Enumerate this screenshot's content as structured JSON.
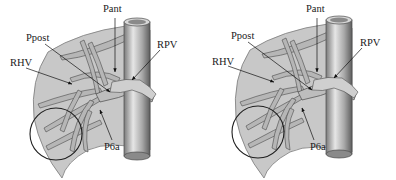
{
  "figure": {
    "panels": [
      {
        "id": "left",
        "labels": {
          "pant": "Pant",
          "ppost": "Ppost",
          "rhv": "RHV",
          "rpv": "RPV",
          "p6a": "P6a"
        }
      },
      {
        "id": "right",
        "labels": {
          "pant": "Pant",
          "ppost": "Ppost",
          "rhv": "RHV",
          "rpv": "RPV",
          "p6a": "P6a"
        }
      }
    ],
    "colors": {
      "liver_fill": "#c8c8c8",
      "liver_stroke": "#6e6e6e",
      "vessel_fill": "#b4b4b4",
      "vessel_stroke": "#4a4a4a",
      "ivc_light": "#e0e0e0",
      "ivc_dark": "#6a6a6a",
      "circle_stroke": "#1e1e1e",
      "arrow": "#111111"
    }
  }
}
